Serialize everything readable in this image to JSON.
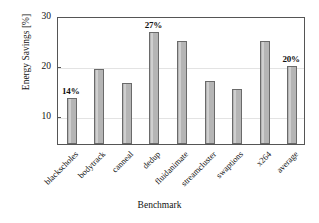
{
  "chart_data": {
    "type": "bar",
    "title": "",
    "xlabel": "Benchmark",
    "ylabel": "Energy Savings [%]",
    "categories": [
      "blackscholes",
      "bodytrack",
      "canneal",
      "dedup",
      "fluidanimate",
      "streamcluster",
      "swaptions",
      "x264",
      "average"
    ],
    "values": [
      13.5,
      19.3,
      16.5,
      26.8,
      25.0,
      17.0,
      15.3,
      24.9,
      19.9
    ],
    "point_labels": [
      "14%",
      "",
      "",
      "27%",
      "",
      "",
      "",
      "",
      "20%"
    ],
    "ylim": [
      4.3,
      30
    ],
    "yticks": [
      10,
      20,
      30
    ],
    "ytick_labels": [
      "10",
      "20",
      "30"
    ],
    "grid": true,
    "legend": null,
    "bar_color": "#b5b5b5",
    "bar_edge_color": "#6a6a6a",
    "axis_color": "#555555",
    "grid_color": "#e3e3e3"
  }
}
